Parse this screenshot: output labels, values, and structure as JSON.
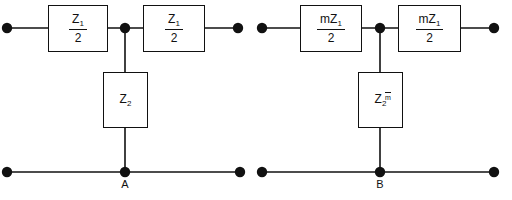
{
  "diagram": {
    "stroke_color": "#111111",
    "background": "#ffffff",
    "circuits": [
      {
        "id": "circuit-a",
        "node_label": "A",
        "series_left": {
          "numerator": "Z",
          "subscript": "1",
          "denominator": "2"
        },
        "series_right": {
          "numerator": "Z",
          "subscript": "1",
          "denominator": "2"
        },
        "shunt": {
          "symbol": "Z",
          "subscript": "2",
          "divisor": ""
        }
      },
      {
        "id": "circuit-b",
        "node_label": "B",
        "series_left": {
          "numerator": "mZ",
          "subscript": "1",
          "denominator": "2"
        },
        "series_right": {
          "numerator": "mZ",
          "subscript": "1",
          "denominator": "2"
        },
        "shunt": {
          "symbol": "Z",
          "subscript": "2",
          "divisor": "m"
        }
      }
    ]
  }
}
